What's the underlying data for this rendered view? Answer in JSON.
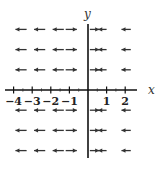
{
  "diagram": {
    "type": "direction_field",
    "axes": {
      "x_label": "x",
      "y_label": "y",
      "x_ticks": [
        -4,
        -3,
        -2,
        -1,
        1,
        2
      ],
      "x_tick_labels": [
        "−4",
        "−3",
        "−2",
        "−1",
        "1",
        "2"
      ],
      "x_range": [
        -4.3,
        2.6
      ],
      "y_range": [
        -3.2,
        3.1
      ]
    },
    "rows_y": [
      3,
      2,
      1,
      -1,
      -2,
      -3
    ],
    "arrows_per_row": [
      {
        "x_from": -3.3,
        "x_to": -3.9,
        "direction": "left"
      },
      {
        "x_from": -2.3,
        "x_to": -2.9,
        "direction": "left"
      },
      {
        "x_from": -1.3,
        "x_to": -1.9,
        "direction": "left"
      },
      {
        "x_from": -1.2,
        "x_to": -0.6,
        "direction": "right"
      },
      {
        "x_from": 0.1,
        "x_to": 0.6,
        "direction": "right"
      },
      {
        "x_from": 1.0,
        "x_to": 0.55,
        "direction": "left"
      },
      {
        "x_from": 2.3,
        "x_to": 1.8,
        "direction": "left"
      }
    ],
    "colors": {
      "axis": "#111111",
      "arrow": "#333333",
      "background": "#ffffff"
    }
  }
}
